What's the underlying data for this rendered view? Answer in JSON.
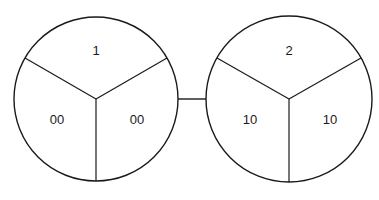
{
  "diagram": {
    "type": "connected-segmented-circles",
    "nodes": [
      {
        "id": "node-1",
        "center": [
          96,
          99
        ],
        "radius": 82,
        "segments": {
          "top": "1",
          "bottom_left": "00",
          "bottom_right": "00"
        }
      },
      {
        "id": "node-2",
        "center": [
          289,
          99
        ],
        "radius": 83,
        "segments": {
          "top": "2",
          "bottom_left": "10",
          "bottom_right": "10"
        }
      }
    ],
    "edges": [
      {
        "from": "node-1",
        "to": "node-2"
      }
    ],
    "colors": {
      "stroke": "#1a1a1a",
      "fill": "#ffffff",
      "text": "#1a1a1a"
    }
  }
}
